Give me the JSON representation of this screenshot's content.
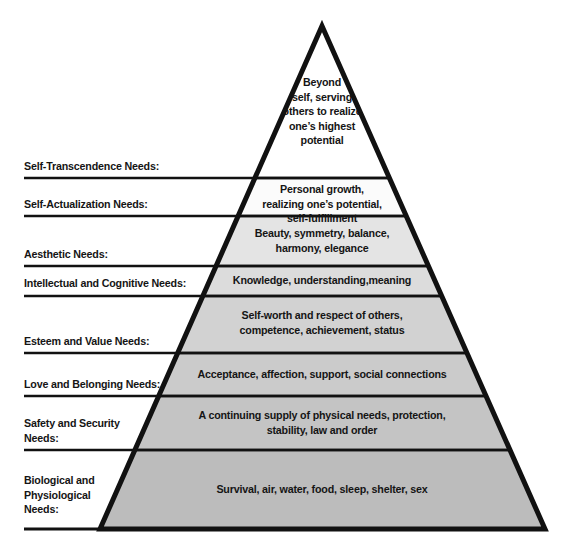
{
  "diagram": {
    "title_cropped": "",
    "background_color": "#ffffff",
    "outline_color": "#111111",
    "text_color": "#151515"
  },
  "tiers": [
    {
      "label": "Self-Transcendence Needs:",
      "content": "Beyond\nself, serving\nothers to realize\none’s highest\npotential",
      "fill": "#ffffff"
    },
    {
      "label": "Self-Actualization Needs:",
      "content": "Personal growth,\nrealizing one’s potential,\nself-fulfillment",
      "fill": "#fbfbfb"
    },
    {
      "label": "Aesthetic Needs:",
      "content": "Beauty, symmetry, balance,\nharmony, elegance",
      "fill": "#e4e4e4"
    },
    {
      "label": "Intellectual and Cognitive Needs:",
      "content": "Knowledge, understanding,meaning",
      "fill": "#dcdcdc"
    },
    {
      "label": "Esteem and Value Needs:",
      "content": "Self-worth and respect of others,\ncompetence, achievement, status",
      "fill": "#d2d2d2"
    },
    {
      "label": "Love and Belonging Needs:",
      "content": "Acceptance, affection, support, social connections",
      "fill": "#cbcbcb"
    },
    {
      "label": "Safety and Security\nNeeds:",
      "content": "A continuing supply of physical needs, protection,\nstability, law and order",
      "fill": "#c4c4c4"
    },
    {
      "label": "Biological and\nPhysiological\nNeeds:",
      "content": "Survival, air, water, food, sleep, shelter, sex",
      "fill": "#bcbcbc"
    }
  ]
}
